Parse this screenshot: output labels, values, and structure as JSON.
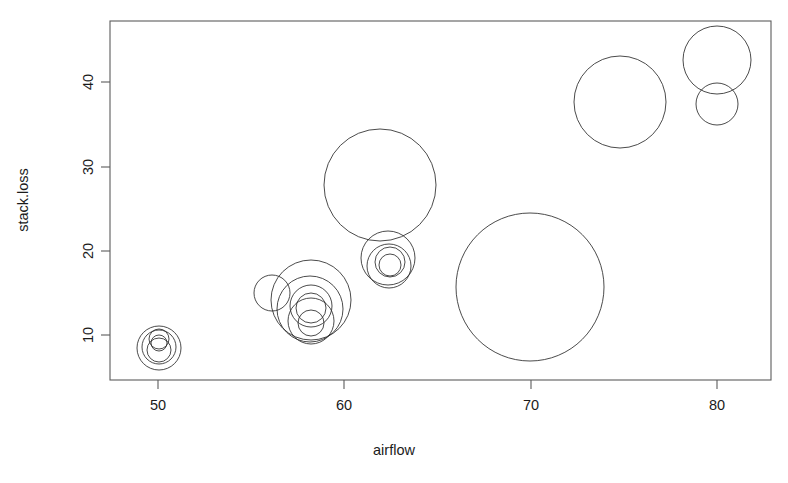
{
  "chart": {
    "type": "scatter",
    "title": "",
    "xlabel": "airflow",
    "ylabel": "stack.loss",
    "symbol_shape": "circle",
    "fill": "none",
    "stroke_color": "#2a2a2a",
    "background": "#ffffff",
    "grid": false,
    "legend": null
  },
  "axes": {
    "x": {
      "label": "airflow",
      "ticks": [
        "50",
        "60",
        "70",
        "80"
      ],
      "tick_values": [
        50,
        60,
        70,
        80
      ],
      "range": [
        47.4,
        82.8
      ]
    },
    "y": {
      "label": "stack.loss",
      "ticks": [
        "10",
        "20",
        "30",
        "40"
      ],
      "tick_values": [
        10,
        20,
        30,
        40
      ],
      "range": [
        5.3,
        47.8
      ]
    }
  },
  "chart_data": {
    "type": "scatter",
    "title": "",
    "xlabel": "airflow",
    "ylabel": "stack.loss",
    "xlim": [
      47.4,
      82.8
    ],
    "ylim": [
      5.3,
      47.8
    ],
    "xticks": [
      50,
      60,
      70,
      80
    ],
    "yticks": [
      10,
      20,
      30,
      40
    ],
    "grid": false,
    "legend_position": "none",
    "marker": "open-circle",
    "size_encoding": "water.temp (bubble radius)",
    "series": [
      {
        "name": "stackloss",
        "x": [
          80,
          80,
          75,
          62,
          62,
          62,
          62,
          62,
          58,
          58,
          58,
          58,
          58,
          58,
          50,
          50,
          50,
          50,
          50,
          56,
          70
        ],
        "y": [
          42,
          37,
          37,
          28,
          18,
          18,
          19,
          20,
          15,
          14,
          14,
          13,
          11,
          12,
          8,
          7,
          8,
          8,
          9,
          15,
          15
        ],
        "r": [
          34,
          21,
          46,
          56,
          27,
          22,
          15,
          11,
          40,
          33,
          21,
          15,
          13,
          23,
          22,
          17,
          10,
          8,
          9,
          18,
          74
        ]
      }
    ],
    "points": [
      {
        "x": 80.0,
        "y": 42.0,
        "r_px": 34
      },
      {
        "x": 80.0,
        "y": 37.3,
        "r_px": 21
      },
      {
        "x": 74.7,
        "y": 38.0,
        "r_px": 46
      },
      {
        "x": 62.0,
        "y": 27.9,
        "r_px": 56
      },
      {
        "x": 62.0,
        "y": 19.2,
        "r_px": 27
      },
      {
        "x": 62.0,
        "y": 19.5,
        "r_px": 22
      },
      {
        "x": 62.1,
        "y": 19.0,
        "r_px": 15
      },
      {
        "x": 62.1,
        "y": 18.7,
        "r_px": 11
      },
      {
        "x": 57.9,
        "y": 14.3,
        "r_px": 40
      },
      {
        "x": 57.9,
        "y": 13.3,
        "r_px": 33
      },
      {
        "x": 57.9,
        "y": 13.6,
        "r_px": 21
      },
      {
        "x": 57.9,
        "y": 13.4,
        "r_px": 15
      },
      {
        "x": 57.9,
        "y": 11.6,
        "r_px": 13
      },
      {
        "x": 57.9,
        "y": 11.8,
        "r_px": 23
      },
      {
        "x": 55.9,
        "y": 15.1,
        "r_px": 18
      },
      {
        "x": 70.0,
        "y": 15.4,
        "r_px": 74
      },
      {
        "x": 49.9,
        "y": 8.3,
        "r_px": 22
      },
      {
        "x": 49.9,
        "y": 8.4,
        "r_px": 17
      },
      {
        "x": 49.9,
        "y": 9.3,
        "r_px": 10
      },
      {
        "x": 49.9,
        "y": 8.6,
        "r_px": 8
      },
      {
        "x": 49.9,
        "y": 7.8,
        "r_px": 12
      }
    ]
  },
  "geometry": {
    "frame": {
      "left": 110,
      "top": 21,
      "right": 771,
      "bottom": 380
    },
    "x_tick_px": [
      158,
      344,
      531,
      717
    ],
    "y_tick_px": [
      335,
      251,
      167,
      82
    ],
    "bubbles_px": [
      {
        "cx": 717,
        "cy": 60,
        "r": 34
      },
      {
        "cx": 717,
        "cy": 104,
        "r": 21
      },
      {
        "cx": 620,
        "cy": 102,
        "r": 46
      },
      {
        "cx": 380,
        "cy": 185,
        "r": 56
      },
      {
        "cx": 388,
        "cy": 258,
        "r": 27
      },
      {
        "cx": 389,
        "cy": 266,
        "r": 22
      },
      {
        "cx": 390,
        "cy": 262,
        "r": 15
      },
      {
        "cx": 390,
        "cy": 265,
        "r": 11
      },
      {
        "cx": 311,
        "cy": 300,
        "r": 40
      },
      {
        "cx": 310,
        "cy": 309,
        "r": 33
      },
      {
        "cx": 311,
        "cy": 306,
        "r": 21
      },
      {
        "cx": 311,
        "cy": 308,
        "r": 15
      },
      {
        "cx": 311,
        "cy": 323,
        "r": 13
      },
      {
        "cx": 311,
        "cy": 321,
        "r": 23
      },
      {
        "cx": 272,
        "cy": 293,
        "r": 18
      },
      {
        "cx": 530,
        "cy": 287,
        "r": 74
      },
      {
        "cx": 159,
        "cy": 348,
        "r": 22
      },
      {
        "cx": 159,
        "cy": 347,
        "r": 17
      },
      {
        "cx": 159,
        "cy": 339,
        "r": 10
      },
      {
        "cx": 159,
        "cy": 343,
        "r": 8
      },
      {
        "cx": 159,
        "cy": 350,
        "r": 12
      }
    ]
  }
}
